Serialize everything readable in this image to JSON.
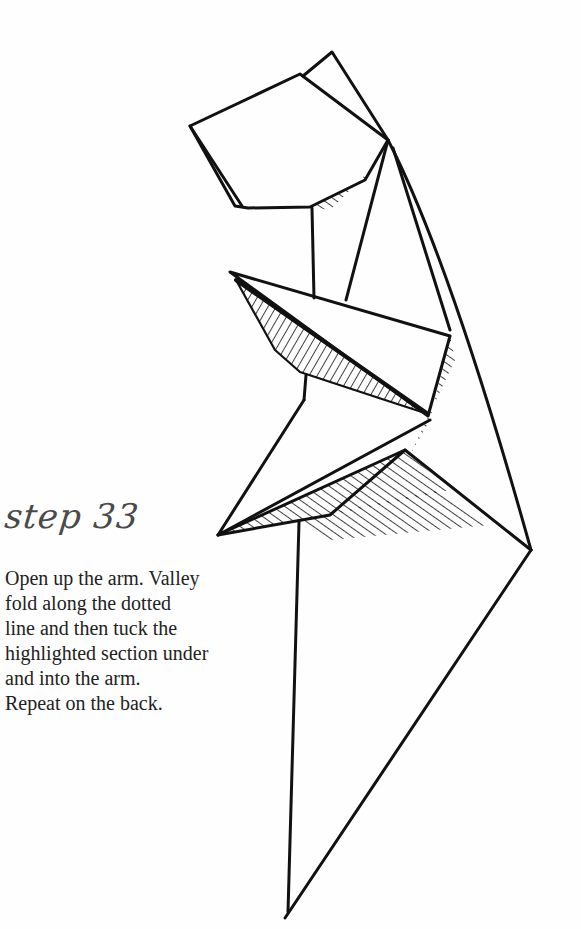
{
  "step": {
    "label": "step 33"
  },
  "instructions": {
    "lines": [
      "Open up the arm. Valley",
      "fold along the dotted",
      "line and then tuck the",
      "highlighted section under",
      "and into the arm.",
      "Repeat on the back."
    ]
  },
  "diagram": {
    "ink_color": "#111111",
    "background": "#fefefe"
  }
}
